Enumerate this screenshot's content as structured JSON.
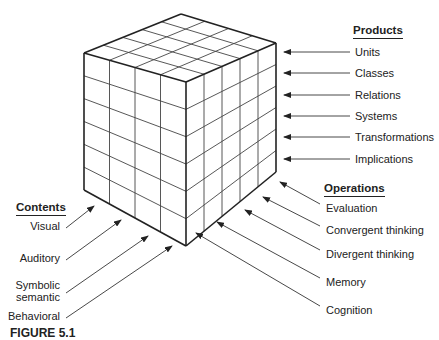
{
  "diagram": {
    "type": "isometric-cube",
    "cube_dims": {
      "contents_columns": 4,
      "operations_columns": 5,
      "products_rows": 6
    },
    "colors": {
      "line": "#333333",
      "text": "#222222",
      "background": "#ffffff"
    }
  },
  "products": {
    "header": "Products",
    "items": [
      "Units",
      "Classes",
      "Relations",
      "Systems",
      "Transformations",
      "Implications"
    ]
  },
  "operations": {
    "header": "Operations",
    "items": [
      "Evaluation",
      "Convergent thinking",
      "Divergent thinking",
      "Memory",
      "Cognition"
    ]
  },
  "contents": {
    "header": "Contents",
    "items": [
      "Visual",
      "Auditory",
      "Symbolic\nsemantic",
      "Behavioral"
    ],
    "item_lines": [
      [
        "Visual"
      ],
      [
        "Auditory"
      ],
      [
        "Symbolic",
        "semantic"
      ],
      [
        "Behavioral"
      ]
    ]
  },
  "caption": {
    "figure_label": "FIGURE 5.1",
    "rest": ""
  }
}
